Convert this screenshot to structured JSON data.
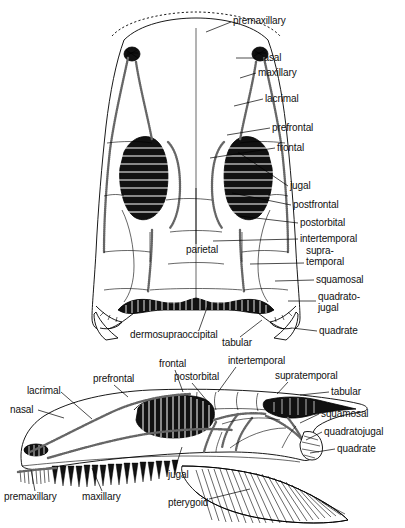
{
  "figure": {
    "background_color": "#ffffff",
    "ink_color": "#000000"
  },
  "views": [
    {
      "name": "dorsal-view",
      "orientation": "dorsal",
      "labels": [
        {
          "id": "premaxillary",
          "text": "premaxillary",
          "x": 233,
          "y": 16,
          "lead": "M231,22 L206,32"
        },
        {
          "id": "nasal",
          "text": "nasal",
          "x": 258,
          "y": 53,
          "lead": "M256,58 L236,58"
        },
        {
          "id": "maxillary",
          "text": "maxillary",
          "x": 258,
          "y": 68,
          "lead": "M256,73 L240,78"
        },
        {
          "id": "lacrimal",
          "text": "lacrimal",
          "x": 265,
          "y": 94,
          "lead": "M263,99 L234,106"
        },
        {
          "id": "prefrontal",
          "text": "prefrontal",
          "x": 272,
          "y": 123,
          "lead": "M270,128 L227,135"
        },
        {
          "id": "frontal",
          "text": "frontal",
          "x": 277,
          "y": 143,
          "lead": "M275,148 L210,158"
        },
        {
          "id": "jugal",
          "text": "jugal",
          "x": 290,
          "y": 181,
          "lead": "M288,186 L238,152"
        },
        {
          "id": "postfrontal",
          "text": "postfrontal",
          "x": 293,
          "y": 200,
          "lead": "M291,205 L232,193"
        },
        {
          "id": "postorbital",
          "text": "postorbital",
          "x": 300,
          "y": 218,
          "lead": "M298,223 L239,216"
        },
        {
          "id": "intertemporal",
          "text": "intertemporal",
          "x": 300,
          "y": 234,
          "lead": "M298,239 L213,241"
        },
        {
          "id": "supra-temporal",
          "text": "supra-\ntemporal",
          "x": 306,
          "y": 246,
          "lead": "M304,263 L250,264"
        },
        {
          "id": "squamosal",
          "text": "squamosal",
          "x": 316,
          "y": 275,
          "lead": "M314,280 L275,281"
        },
        {
          "id": "quadrato-jugal",
          "text": "quadrato-\njugal",
          "x": 318,
          "y": 292,
          "lead": "M316,301 L288,301"
        },
        {
          "id": "quadrate",
          "text": "quadrate",
          "x": 319,
          "y": 326,
          "lead": "M317,331 L292,328"
        },
        {
          "id": "parietal",
          "text": "parietal",
          "x": 186,
          "y": 245,
          "lead": "M196,244 L196,188"
        },
        {
          "id": "dermosupraoccipital",
          "text": "dermosupraoccipital",
          "x": 130,
          "y": 330,
          "lead": "M199,330 L208,305"
        },
        {
          "id": "tabular",
          "text": "tabular",
          "x": 222,
          "y": 338,
          "lead": "M240,337 L262,320"
        }
      ]
    },
    {
      "name": "lateral-view",
      "orientation": "lateral",
      "labels": [
        {
          "id": "frontal",
          "text": "frontal",
          "x": 159,
          "y": 359,
          "lead": "M175,370 L183,392"
        },
        {
          "id": "intertemporal",
          "text": "intertemporal",
          "x": 228,
          "y": 356,
          "lead": "M236,367 L218,392"
        },
        {
          "id": "supratemporal",
          "text": "supratemporal",
          "x": 275,
          "y": 371,
          "lead": "M288,382 L277,394"
        },
        {
          "id": "postorbital",
          "text": "postorbital",
          "x": 174,
          "y": 372,
          "lead": "M192,383 L208,402"
        },
        {
          "id": "prefrontal",
          "text": "prefrontal",
          "x": 93,
          "y": 374,
          "lead": "M114,385 L128,397"
        },
        {
          "id": "tabular",
          "text": "tabular",
          "x": 331,
          "y": 387,
          "lead": "M329,392 L300,395"
        },
        {
          "id": "lacrimal",
          "text": "lacrimal",
          "x": 27,
          "y": 386,
          "lead": "M61,392 L92,419"
        },
        {
          "id": "nasal",
          "text": "nasal",
          "x": 10,
          "y": 405,
          "lead": "M38,410 L64,418"
        },
        {
          "id": "squamosal",
          "text": "squamosal",
          "x": 321,
          "y": 409,
          "lead": "M319,414 L300,423"
        },
        {
          "id": "quadratojugal",
          "text": "quadratojugal",
          "x": 324,
          "y": 427,
          "lead": "M322,432 L306,440"
        },
        {
          "id": "quadrate",
          "text": "quadrate",
          "x": 337,
          "y": 444,
          "lead": "M335,449 L310,453"
        },
        {
          "id": "premaxillary",
          "text": "premaxillary",
          "x": 4,
          "y": 492,
          "lead": "M35,491 L31,470"
        },
        {
          "id": "maxillary",
          "text": "maxillary",
          "x": 82,
          "y": 492,
          "lead": "M102,491 L92,468"
        },
        {
          "id": "jugal",
          "text": "jugal",
          "x": 168,
          "y": 470,
          "lead": "M175,469 L182,447"
        },
        {
          "id": "pterygoid",
          "text": "pterygoid",
          "x": 168,
          "y": 498,
          "lead": "M209,499 L250,489"
        }
      ]
    }
  ],
  "anatomy_terms": [
    "premaxillary",
    "nasal",
    "maxillary",
    "lacrimal",
    "prefrontal",
    "frontal",
    "jugal",
    "postfrontal",
    "postorbital",
    "intertemporal",
    "supratemporal",
    "squamosal",
    "quadratojugal",
    "quadrate",
    "parietal",
    "dermosupraoccipital",
    "tabular",
    "pterygoid"
  ]
}
